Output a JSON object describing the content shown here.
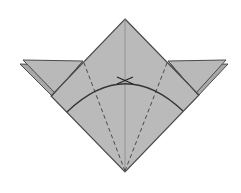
{
  "diagram": {
    "type": "origami-fold-diagram",
    "colors": {
      "paper": "#b9b9b9",
      "paper_dark": "#a9a9a9",
      "edge": "#4a4a4a",
      "crease": "#5a5a5a",
      "background": "#ffffff"
    },
    "elements": {
      "main_diamond": "Square paper in diamond orientation",
      "left_flap": "Left triangular flap behind",
      "right_flap": "Right triangular flap behind",
      "center_crease": "Vertical center crease (valley)",
      "left_valley_fold": "Dashed valley fold line from bottom to left",
      "right_valley_fold": "Dashed valley fold line from bottom to right",
      "arc_reference": "Curved reference arc across the model",
      "pinch_mark": "Crossing pinch mark at center intersection"
    }
  }
}
